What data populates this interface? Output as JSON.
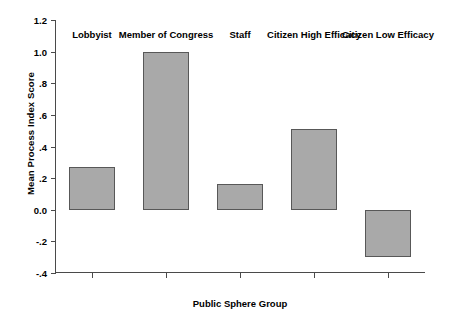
{
  "chart_data": {
    "type": "bar",
    "title": "",
    "categories": [
      "Lobbyist",
      "Member of Congress",
      "Staff",
      "Citizen High Efficacy",
      "Citizen Low Efficacy"
    ],
    "values": [
      0.27,
      1.0,
      0.16,
      0.51,
      -0.3
    ],
    "xlabel": "Public Sphere Group",
    "ylabel": "Mean Process Index Score",
    "ylim": [
      -0.4,
      1.2
    ],
    "yticks": [
      1.2,
      1.0,
      0.8,
      0.6,
      0.4,
      0.2,
      0.0,
      -0.2,
      -0.4
    ],
    "ytick_labels": [
      "1.2",
      "1.0",
      ".8",
      ".6",
      ".4",
      ".2",
      "0.0",
      "-.2",
      "-.4"
    ],
    "grid": false,
    "legend": null,
    "bar_color": "#a9a9a9",
    "bar_edge_color": "#585858",
    "axis_color": "#4a4a4a",
    "background": "#ffffff"
  }
}
